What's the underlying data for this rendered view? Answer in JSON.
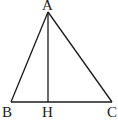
{
  "diagram": {
    "type": "geometry-triangle",
    "points": {
      "A": {
        "label": "A",
        "x": 48,
        "y": 12
      },
      "B": {
        "label": "B",
        "x": 11,
        "y": 102
      },
      "C": {
        "label": "C",
        "x": 112,
        "y": 102
      },
      "H": {
        "label": "H",
        "x": 48,
        "y": 102
      }
    },
    "segments": [
      "AB",
      "AC",
      "BC",
      "AH"
    ],
    "colors": {
      "stroke": "#1a1a1a",
      "background": "#ffffff"
    }
  }
}
